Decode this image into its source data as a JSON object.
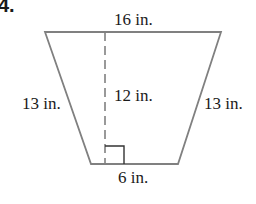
{
  "problem": {
    "number": "4."
  },
  "figure": {
    "shape": "isosceles trapezoid",
    "labels": {
      "top_base": "16 in.",
      "bottom_base": "6 in.",
      "left_leg": "13 in.",
      "right_leg": "13 in.",
      "height": "12 in."
    },
    "colors": {
      "outline": "#808080",
      "dashed_height": "#808080",
      "text": "#1a1a1a",
      "background": "#ffffff"
    }
  }
}
